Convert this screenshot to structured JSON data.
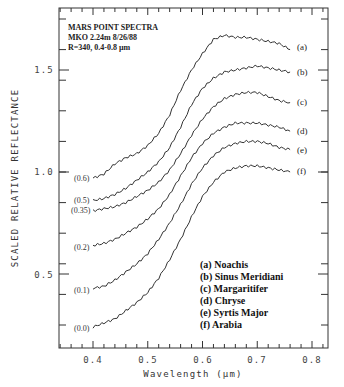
{
  "chart_data": {
    "type": "line",
    "title": "MARS POINT SPECTRA",
    "subtitle": [
      "MKO 2.24m 8/26/88",
      "R=340,  0.4-0.8 µm"
    ],
    "xlabel": "Wavelength  (µm)",
    "ylabel": "SCALED RELATIVE REFLECTANCE",
    "xlim": [
      0.34,
      0.83
    ],
    "ylim": [
      0.06,
      1.8
    ],
    "x_ticks": [
      0.4,
      0.5,
      0.6,
      0.7,
      0.8
    ],
    "x_tick_labels": [
      "0.4",
      "0.5",
      "0.6",
      "0.7",
      "0.8"
    ],
    "y_ticks": [
      0.5,
      1.0,
      1.5
    ],
    "y_tick_labels": [
      "0.5",
      "1.0",
      "1.5"
    ],
    "grid": false,
    "legend_position": "lower right",
    "legend": [
      "(a) Noachis",
      "(b) Sinus Meridiani",
      "(c) Margaritifer",
      "(d) Chryse",
      "(e) Syrtis Major",
      "(f) Arabia"
    ],
    "x": [
      0.4,
      0.42,
      0.44,
      0.46,
      0.48,
      0.5,
      0.52,
      0.54,
      0.56,
      0.58,
      0.6,
      0.62,
      0.64,
      0.66,
      0.68,
      0.7,
      0.72,
      0.74,
      0.76
    ],
    "series": [
      {
        "name": "(a)",
        "label": "Noachis",
        "offset": "(0.6)",
        "values": [
          0.97,
          0.99,
          1.04,
          1.07,
          1.09,
          1.13,
          1.19,
          1.28,
          1.4,
          1.5,
          1.58,
          1.65,
          1.67,
          1.66,
          1.66,
          1.65,
          1.64,
          1.63,
          1.6
        ]
      },
      {
        "name": "(b)",
        "label": "Sinus Meridiani",
        "offset": "(0.5)",
        "values": [
          0.86,
          0.87,
          0.89,
          0.92,
          0.96,
          1.0,
          1.05,
          1.12,
          1.22,
          1.33,
          1.41,
          1.46,
          1.49,
          1.5,
          1.51,
          1.52,
          1.51,
          1.5,
          1.49
        ]
      },
      {
        "name": "(c)",
        "label": "Margaritifer",
        "offset": "(0.35)",
        "values": [
          0.81,
          0.82,
          0.83,
          0.85,
          0.88,
          0.91,
          0.95,
          1.01,
          1.09,
          1.18,
          1.26,
          1.32,
          1.36,
          1.38,
          1.39,
          1.39,
          1.37,
          1.35,
          1.34
        ]
      },
      {
        "name": "(d)",
        "label": "Chryse",
        "offset": "(0.2)",
        "values": [
          0.64,
          0.65,
          0.67,
          0.7,
          0.73,
          0.77,
          0.82,
          0.89,
          0.98,
          1.07,
          1.14,
          1.19,
          1.22,
          1.24,
          1.24,
          1.24,
          1.23,
          1.22,
          1.2
        ]
      },
      {
        "name": "(e)",
        "label": "Syrtis Major",
        "offset": "(0.1)",
        "values": [
          0.43,
          0.44,
          0.47,
          0.51,
          0.55,
          0.6,
          0.67,
          0.75,
          0.84,
          0.94,
          1.02,
          1.08,
          1.12,
          1.14,
          1.15,
          1.15,
          1.14,
          1.12,
          1.11
        ]
      },
      {
        "name": "(f)",
        "label": "Arabia",
        "offset": "(0.0)",
        "values": [
          0.24,
          0.26,
          0.28,
          0.32,
          0.36,
          0.41,
          0.48,
          0.57,
          0.67,
          0.78,
          0.88,
          0.95,
          1.0,
          1.02,
          1.03,
          1.03,
          1.02,
          1.01,
          1.0
        ]
      }
    ]
  },
  "annotation": {
    "line1": "MARS POINT SPECTRA",
    "line2": "MKO 2.24m 8/26/88",
    "line3": "R=340,  0.4-0.8 µm"
  },
  "axes": {
    "xlabel": "Wavelength  (µm)",
    "ylabel": "SCALED RELATIVE REFLECTANCE",
    "x_tick_labels": [
      "0.4",
      "0.5",
      "0.6",
      "0.7",
      "0.8"
    ],
    "y_tick_labels": [
      "0.5",
      "1.0",
      "1.5"
    ]
  },
  "offsets": [
    "(0.6)",
    "(0.5)",
    "(0.35)",
    "(0.2)",
    "(0.1)",
    "(0.0)"
  ],
  "curve_labels": [
    "(a)",
    "(b)",
    "(c)",
    "(d)",
    "(e)",
    "(f)"
  ],
  "legend": [
    "(a) Noachis",
    "(b) Sinus Meridiani",
    "(c) Margaritifer",
    "(d) Chryse",
    "(e) Syrtis Major",
    "(f) Arabia"
  ]
}
